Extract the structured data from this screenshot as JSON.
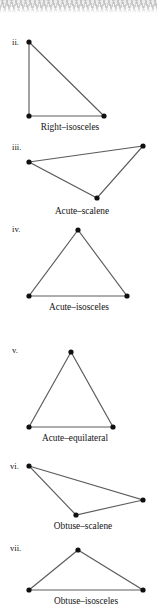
{
  "figure": {
    "background_color": "#ffffff",
    "edge_color": "#5c5c5c",
    "vertex_color": "#101010",
    "text_color": "#141414",
    "top_texture": {
      "present": true,
      "color": "#c8c8c8",
      "description": "clipped hatched texture band"
    }
  },
  "chart_data": {
    "type": "diagram",
    "title": "",
    "subtitle": "",
    "xlabel": "",
    "ylabel": "",
    "grid": false,
    "legend": "none",
    "width": 157,
    "height": 610,
    "items": [
      {
        "index": "ii.",
        "caption": "Right–isosceles",
        "label_pos": {
          "x": 12,
          "y": 45
        },
        "caption_pos": {
          "x": 70,
          "y": 130
        },
        "vertices": [
          {
            "x": 29,
            "y": 42
          },
          {
            "x": 29,
            "y": 116
          },
          {
            "x": 104,
            "y": 116
          }
        ]
      },
      {
        "index": "iii.",
        "caption": "Acute–scalene",
        "label_pos": {
          "x": 12,
          "y": 150
        },
        "caption_pos": {
          "x": 82,
          "y": 214
        },
        "vertices": [
          {
            "x": 29,
            "y": 162
          },
          {
            "x": 143,
            "y": 146
          },
          {
            "x": 97,
            "y": 198
          }
        ]
      },
      {
        "index": "iv.",
        "caption": "Acute–isosceles",
        "label_pos": {
          "x": 12,
          "y": 232
        },
        "caption_pos": {
          "x": 79,
          "y": 310
        },
        "vertices": [
          {
            "x": 78,
            "y": 230
          },
          {
            "x": 29,
            "y": 296
          },
          {
            "x": 127,
            "y": 296
          }
        ]
      },
      {
        "index": "v.",
        "caption": "Acute–equilateral",
        "label_pos": {
          "x": 12,
          "y": 353
        },
        "caption_pos": {
          "x": 75,
          "y": 441
        },
        "vertices": [
          {
            "x": 71,
            "y": 352
          },
          {
            "x": 29,
            "y": 427
          },
          {
            "x": 113,
            "y": 427
          }
        ]
      },
      {
        "index": "vi.",
        "caption": "Obtuse–scalene",
        "label_pos": {
          "x": 10,
          "y": 469
        },
        "caption_pos": {
          "x": 83,
          "y": 529
        },
        "vertices": [
          {
            "x": 29,
            "y": 466
          },
          {
            "x": 143,
            "y": 500
          },
          {
            "x": 76,
            "y": 515
          }
        ]
      },
      {
        "index": "vii.",
        "caption": "Obtuse–isosceles",
        "label_pos": {
          "x": 10,
          "y": 551
        },
        "caption_pos": {
          "x": 86,
          "y": 604
        },
        "vertices": [
          {
            "x": 78,
            "y": 550
          },
          {
            "x": 29,
            "y": 590
          },
          {
            "x": 143,
            "y": 590
          }
        ]
      }
    ]
  }
}
